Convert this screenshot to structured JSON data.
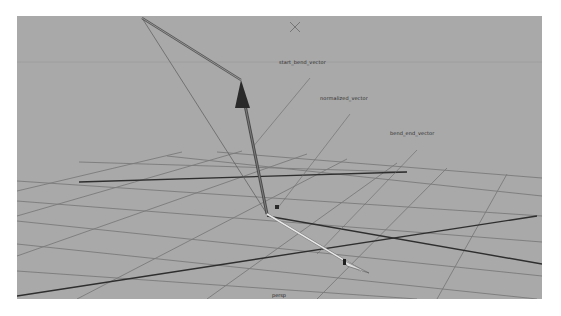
{
  "viewport": {
    "camera_name": "persp",
    "background_color": "#a9a9a9",
    "horizon_y": 46
  },
  "labels": [
    {
      "text": "start_bend_vector",
      "x": 279,
      "y": 59
    },
    {
      "text": "normalized_vector",
      "x": 320,
      "y": 95
    },
    {
      "text": "bend_end_vector",
      "x": 390,
      "y": 130
    }
  ],
  "grid": {
    "color": "#7a7a7a",
    "axis_color": "#2e2e2e",
    "lines": [
      [
        62,
        146,
        390,
        156
      ],
      [
        0,
        165,
        525,
        200
      ],
      [
        0,
        185,
        525,
        226
      ],
      [
        0,
        205,
        525,
        260
      ],
      [
        0,
        228,
        520,
        283
      ],
      [
        0,
        255,
        400,
        283
      ],
      [
        150,
        140,
        525,
        180
      ],
      [
        200,
        136,
        525,
        162
      ],
      [
        0,
        200,
        225,
        135
      ],
      [
        0,
        240,
        290,
        138
      ],
      [
        60,
        283,
        330,
        143
      ],
      [
        190,
        283,
        380,
        147
      ],
      [
        300,
        283,
        430,
        152
      ],
      [
        420,
        283,
        490,
        158
      ],
      [
        0,
        175,
        165,
        136
      ]
    ],
    "axes": [
      [
        62,
        166,
        390,
        156
      ],
      [
        0,
        280,
        520,
        200
      ],
      [
        250,
        200,
        525,
        248
      ]
    ]
  },
  "vectors": {
    "main_up": {
      "x1": 250,
      "y1": 198,
      "x2": 225,
      "y2": 74,
      "color": "#4a4a4a"
    },
    "main_up_head": {
      "points": "218,92 233,92 224,64"
    },
    "top_arm": {
      "x1": 224,
      "y1": 64,
      "x2": 125,
      "y2": 2,
      "color": "#555555"
    },
    "thin_back": {
      "x1": 250,
      "y1": 198,
      "x2": 125,
      "y2": 2,
      "color": "#5a5a5a"
    },
    "bend_end": {
      "x1": 250,
      "y1": 198,
      "x2": 345,
      "y2": 255,
      "color": "#e8e8e8"
    },
    "bend_end_head": {
      "points": "326,244 352,257 330,250"
    },
    "leader_start": {
      "x1": 293,
      "y1": 62,
      "x2": 235,
      "y2": 132
    },
    "leader_normalized": {
      "x1": 333,
      "y1": 98,
      "x2": 260,
      "y2": 193
    },
    "leader_bend_end": {
      "x1": 400,
      "y1": 134,
      "x2": 300,
      "y2": 238
    }
  },
  "marker": {
    "x": 278,
    "y": 11,
    "size": 5,
    "icon": "cross-marker-icon"
  }
}
